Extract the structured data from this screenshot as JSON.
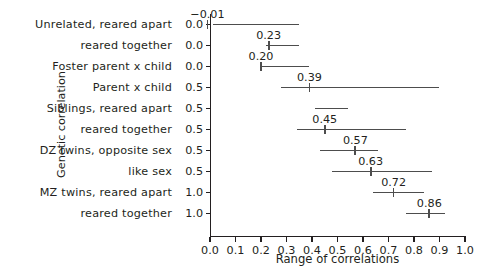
{
  "chart_data": {
    "type": "bar",
    "title": "",
    "xlabel": "Range of correlations",
    "ylabel": "Genetic correlation",
    "xlim": [
      0.0,
      1.0
    ],
    "grid": false,
    "legend": null,
    "x_ticks": [
      "0.0",
      "0.1",
      "0.2",
      "0.3",
      "0.4",
      "0.5",
      "0.6",
      "0.7",
      "0.8",
      "0.9",
      "1.0"
    ],
    "x_tick_values": [
      0.0,
      0.1,
      0.2,
      0.3,
      0.4,
      0.5,
      0.6,
      0.7,
      0.8,
      0.9,
      1.0
    ],
    "categories": [
      "Unrelated, reared apart",
      "reared together",
      "Foster parent x child",
      "Parent x child",
      "Siblings, reared apart",
      "reared together",
      "DZ twins, opposite sex",
      "like sex",
      "MZ twins, reared apart",
      "reared together"
    ],
    "y_tick_labels": [
      "0.0",
      "0.0",
      "0.0",
      "0.5",
      "0.5",
      "0.5",
      "0.5",
      "0.5",
      "1.0",
      "1.0"
    ],
    "genetic_correlation": [
      0.0,
      0.0,
      0.0,
      0.5,
      0.5,
      0.5,
      0.5,
      0.5,
      1.0,
      1.0
    ],
    "rows": [
      {
        "category": "Unrelated, reared apart",
        "y_tick": "0.0",
        "value": -0.01,
        "label": "−0.01",
        "range_low": 0.01,
        "range_high": 0.35
      },
      {
        "category": "reared together",
        "y_tick": "0.0",
        "value": 0.23,
        "label": "0.23",
        "range_low": 0.22,
        "range_high": 0.35
      },
      {
        "category": "Foster parent x child",
        "y_tick": "0.0",
        "value": 0.2,
        "label": "0.20",
        "range_low": 0.2,
        "range_high": 0.39
      },
      {
        "category": "Parent x child",
        "y_tick": "0.5",
        "value": 0.39,
        "label": "0.39",
        "range_low": 0.28,
        "range_high": 0.9
      },
      {
        "category": "Siblings, reared apart",
        "y_tick": "0.5",
        "value": null,
        "label": "",
        "range_low": 0.41,
        "range_high": 0.54
      },
      {
        "category": "reared together",
        "y_tick": "0.5",
        "value": 0.45,
        "label": "0.45",
        "range_low": 0.34,
        "range_high": 0.77
      },
      {
        "category": "DZ twins, opposite sex",
        "y_tick": "0.5",
        "value": 0.57,
        "label": "0.57",
        "range_low": 0.43,
        "range_high": 0.66
      },
      {
        "category": "like sex",
        "y_tick": "0.5",
        "value": 0.63,
        "label": "0.63",
        "range_low": 0.48,
        "range_high": 0.87
      },
      {
        "category": "MZ twins, reared apart",
        "y_tick": "1.0",
        "value": 0.72,
        "label": "0.72",
        "range_low": 0.64,
        "range_high": 0.84
      },
      {
        "category": "reared together",
        "y_tick": "1.0",
        "value": 0.86,
        "label": "0.86",
        "range_low": 0.77,
        "range_high": 0.92
      }
    ]
  },
  "colors": {
    "ink": "#231f20",
    "data": "#4d4d4d",
    "background": "#ffffff"
  }
}
